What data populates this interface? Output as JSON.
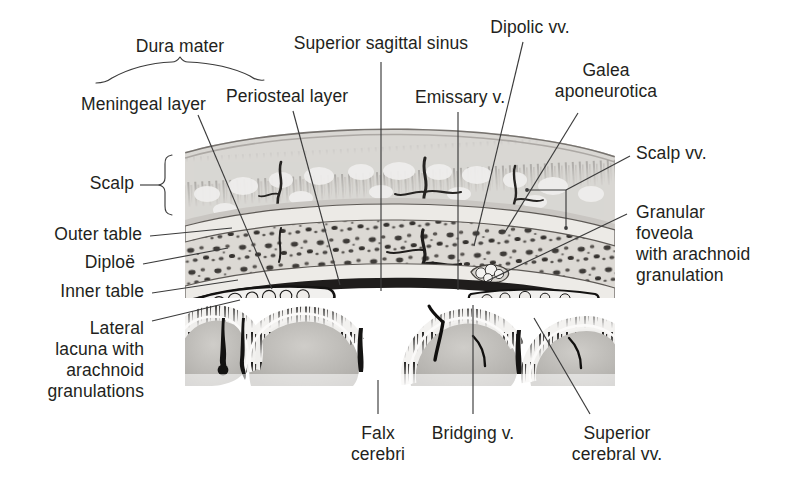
{
  "figure": {
    "kind": "anatomical-illustration",
    "style": "grayscale histological cross-section drawing"
  },
  "labels": {
    "dura_mater": "Dura mater",
    "meningeal_layer": "Meningeal layer",
    "periosteal_layer": "Periosteal layer",
    "superior_sagittal_sinus": "Superior sagittal sinus",
    "emissary_v": "Emissary v.",
    "dipolic_vv": "Dipolic vv.",
    "galea_aponeurotica": "Galea\naponeurotica",
    "scalp_vv": "Scalp vv.",
    "scalp": "Scalp",
    "outer_table": "Outer table",
    "diploe": "Diploë",
    "inner_table": "Inner table",
    "granular_foveola": "Granular\nfoveola\nwith arachnoid\ngranulation",
    "lateral_lacuna": "Lateral\nlacuna with\narachnoid\ngranulations",
    "falx_cerebri": "Falx\ncerebri",
    "bridging_v": "Bridging v.",
    "superior_cerebral_vv": "Superior\ncerebral vv."
  },
  "colors": {
    "background": "#ffffff",
    "text": "#231f20",
    "leader_line": "#3b3b3b",
    "scalp_tissue": "#d8d6d2",
    "hair_follicle": "#8d8a86",
    "outer_table": "#e9e7e3",
    "diploe": "#ddd9d4",
    "diploe_cell": "#45423f",
    "inner_table": "#eceae6",
    "dura": "#2b2826",
    "sinus_lumen": "#1c1a19",
    "brain_cortex": "#b9b7b3",
    "subarachnoid": "#f4f3f1",
    "vein": "#3a3735"
  }
}
